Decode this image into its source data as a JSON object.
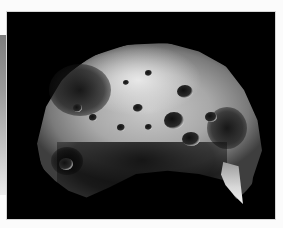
{
  "image": {
    "subject": "cratered irregular moon",
    "alt": "Grayscale photograph of a heavily cratered, irregularly shaped moon against a black background",
    "background_color": "#000000",
    "frame_color": "#fbfbfb",
    "side_strip_gradient": [
      "#7c7c7c",
      "#ececec"
    ]
  }
}
